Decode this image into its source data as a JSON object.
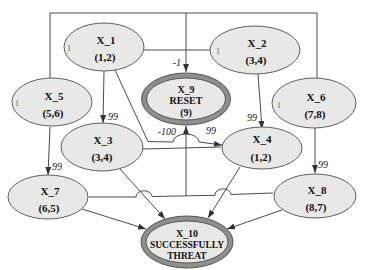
{
  "diagram": {
    "nodes": {
      "x1": {
        "name": "X_1",
        "value": "(1,2)",
        "port": "1"
      },
      "x2": {
        "name": "X_2",
        "value": "(3,4)",
        "port": "1"
      },
      "x3": {
        "name": "X_3",
        "value": "(3,4)"
      },
      "x4": {
        "name": "X_4",
        "value": "(1,2)"
      },
      "x5": {
        "name": "X_5",
        "value": "(5,6)",
        "port": "1"
      },
      "x6": {
        "name": "X_6",
        "value": "(7,8)",
        "port": "1"
      },
      "x7": {
        "name": "X_7",
        "value": "(6,5)"
      },
      "x8": {
        "name": "X_8",
        "value": "(8,7)"
      },
      "x9": {
        "name": "X_9",
        "line2": "RESET",
        "value": "(9)"
      },
      "x10": {
        "name": "X_10",
        "line2": "SUCCESSFULLY",
        "line3": "THREAT"
      }
    },
    "edge_labels": {
      "into_x9_top": "-1",
      "into_x9_bottom": "-100",
      "x1_to_x3": "99",
      "x2_to_x4": "99",
      "x3_to_x4": "99",
      "x5_to_x7": "99",
      "x6_to_x8": "99"
    },
    "colors": {
      "node_fill": "#e8e8e6",
      "double_ring": "#8f8f8f",
      "line": "#4a4a4a",
      "text": "#111111"
    }
  }
}
